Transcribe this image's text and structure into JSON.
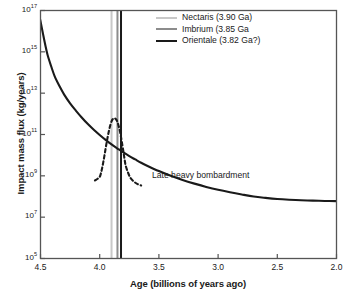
{
  "chart_data": {
    "type": "line",
    "title": "",
    "xlabel": "Age (billions of years ago)",
    "ylabel": "Impact mass flux (kg/years)",
    "xlim": [
      4.5,
      2.0
    ],
    "ylim": [
      100000,
      1e+17
    ],
    "yscale": "log",
    "xscale": "linear",
    "x_reversed": true,
    "grid": false,
    "legend_position": "top-right",
    "xticks": [
      "4.5",
      "4.0",
      "3.5",
      "3.0",
      "2.5",
      "2.0"
    ],
    "xtick_values": [
      4.5,
      4.0,
      3.5,
      3.0,
      2.5,
      2.0
    ],
    "yticks": [
      "10^17",
      "10^15",
      "10^13",
      "10^11",
      "10^9",
      "10^7",
      "10^5"
    ],
    "ytick_values": [
      1e+17,
      1000000000000000.0,
      10000000000000.0,
      100000000000.0,
      1000000000.0,
      10000000.0,
      100000.0
    ],
    "ytick_mantissa": [
      "10",
      "10",
      "10",
      "10",
      "10",
      "10",
      "10"
    ],
    "ytick_exponents": [
      "17",
      "15",
      "13",
      "11",
      "9",
      "7",
      "5"
    ],
    "annotations": [
      {
        "text": "Late heavy bombardment",
        "x": 3.42,
        "y": 1100000000.0
      }
    ],
    "series": [
      {
        "name": "Declining impact flux",
        "style": "solid",
        "color": "#1a1a1a",
        "width": 2.1,
        "points": [
          [
            4.52,
            1e+17
          ],
          [
            4.5,
            3e+16
          ],
          [
            4.48,
            8000000000000000.0
          ],
          [
            4.46,
            2200000000000000.0
          ],
          [
            4.44,
            700000000000000.0
          ],
          [
            4.41,
            200000000000000.0
          ],
          [
            4.38,
            65000000000000.0
          ],
          [
            4.34,
            22000000000000.0
          ],
          [
            4.3,
            8500000000000.0
          ],
          [
            4.25,
            3200000000000.0
          ],
          [
            4.2,
            1400000000000.0
          ],
          [
            4.15,
            650000000000.0
          ],
          [
            4.1,
            320000000000.0
          ],
          [
            4.05,
            170000000000.0
          ],
          [
            4.0,
            95000000000.0
          ],
          [
            3.95,
            55000000000.0
          ],
          [
            3.9,
            33000000000.0
          ],
          [
            3.85,
            21000000000.0
          ],
          [
            3.8,
            13500000000.0
          ],
          [
            3.75,
            9000000000.0
          ],
          [
            3.7,
            6200000000.0
          ],
          [
            3.65,
            4300000000.0
          ],
          [
            3.6,
            3100000000.0
          ],
          [
            3.5,
            1700000000.0
          ],
          [
            3.4,
            1000000000.0
          ],
          [
            3.3,
            630000000.0
          ],
          [
            3.2,
            420000000.0
          ],
          [
            3.1,
            290000000.0
          ],
          [
            3.0,
            210000000.0
          ],
          [
            2.9,
            160000000.0
          ],
          [
            2.8,
            125000000.0
          ],
          [
            2.7,
            100000000.0
          ],
          [
            2.6,
            86000000.0
          ],
          [
            2.5,
            76000000.0
          ],
          [
            2.4,
            70000000.0
          ],
          [
            2.3,
            66000000.0
          ],
          [
            2.2,
            63000000.0
          ],
          [
            2.1,
            61000000.0
          ],
          [
            2.0,
            60000000.0
          ]
        ]
      },
      {
        "name": "Late heavy bombardment spike",
        "style": "dashed",
        "color": "#1a1a1a",
        "width": 2.1,
        "points": [
          [
            4.04,
            600000000.0
          ],
          [
            4.02,
            700000000.0
          ],
          [
            4.0,
            900000000.0
          ],
          [
            3.99,
            1300000000.0
          ],
          [
            3.98,
            2300000000.0
          ],
          [
            3.97,
            4500000000.0
          ],
          [
            3.96,
            9500000000.0
          ],
          [
            3.95,
            21000000000.0
          ],
          [
            3.94,
            45000000000.0
          ],
          [
            3.93,
            90000000000.0
          ],
          [
            3.92,
            170000000000.0
          ],
          [
            3.91,
            290000000000.0
          ],
          [
            3.9,
            430000000000.0
          ],
          [
            3.89,
            550000000000.0
          ],
          [
            3.88,
            620000000000.0
          ],
          [
            3.87,
            600000000000.0
          ],
          [
            3.86,
            520000000000.0
          ],
          [
            3.85,
            400000000000.0
          ],
          [
            3.84,
            260000000000.0
          ],
          [
            3.83,
            150000000000.0
          ],
          [
            3.82,
            75000000000.0
          ],
          [
            3.81,
            34000000000.0
          ],
          [
            3.8,
            15000000000.0
          ],
          [
            3.79,
            6500000000.0
          ],
          [
            3.78,
            3000000000.0
          ],
          [
            3.76,
            1400000000.0
          ],
          [
            3.74,
            800000000.0
          ],
          [
            3.71,
            520000000.0
          ],
          [
            3.68,
            400000000.0
          ],
          [
            3.65,
            340000000.0
          ]
        ]
      }
    ],
    "vlines": [
      {
        "name": "Nectaris",
        "x": 3.9,
        "color": "#c8c8c8",
        "width": 2.0
      },
      {
        "name": "Imbrium",
        "x": 3.85,
        "color": "#8c8c8c",
        "width": 2.0
      },
      {
        "name": "Orientale",
        "x": 3.82,
        "color": "#1a1a1a",
        "width": 2.0
      }
    ]
  },
  "legend": {
    "items": [
      {
        "label": "Nectaris (3.90 Ga)",
        "color": "#c8c8c8"
      },
      {
        "label": "Imbrium (3.85 Ga",
        "color": "#8c8c8c"
      },
      {
        "label": "Orientale (3.82 Ga?)",
        "color": "#1a1a1a"
      }
    ]
  },
  "axes": {
    "xlabel": "Age (billions of years ago)",
    "ylabel": "Impact mass flux (kg/years)",
    "xticks": [
      {
        "label": "4.5",
        "value": 4.5
      },
      {
        "label": "4.0",
        "value": 4.0
      },
      {
        "label": "3.5",
        "value": 3.5
      },
      {
        "label": "3.0",
        "value": 3.0
      },
      {
        "label": "2.5",
        "value": 2.5
      },
      {
        "label": "2.0",
        "value": 2.0
      }
    ],
    "yticks": [
      {
        "mantissa": "10",
        "exponent": "17",
        "value": 1e+17
      },
      {
        "mantissa": "10",
        "exponent": "15",
        "value": 1000000000000000.0
      },
      {
        "mantissa": "10",
        "exponent": "13",
        "value": 10000000000000.0
      },
      {
        "mantissa": "10",
        "exponent": "11",
        "value": 100000000000.0
      },
      {
        "mantissa": "10",
        "exponent": "9",
        "value": 1000000000.0
      },
      {
        "mantissa": "10",
        "exponent": "7",
        "value": 10000000.0
      },
      {
        "mantissa": "10",
        "exponent": "5",
        "value": 100000.0
      }
    ]
  },
  "annotation": {
    "lhb_label": "Late heavy bombardment"
  },
  "colors": {
    "axis": "#555555",
    "curve": "#1a1a1a",
    "nectaris": "#c8c8c8",
    "imbrium": "#8c8c8c",
    "orientale": "#1a1a1a",
    "background": "#ffffff"
  }
}
